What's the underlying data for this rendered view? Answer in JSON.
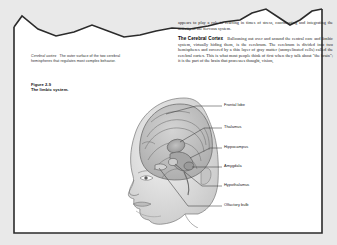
{
  "page": {
    "background_color": "#e9e9e9",
    "sheet_color": "#ffffff",
    "border_color": "#2b2b2b",
    "torn_edge": "jagged"
  },
  "left_column": {
    "glossary": {
      "term": "Cerebral cortex",
      "definition": "The outer surface of the two cerebral hemispheres that regulates most complex behavior."
    },
    "figure_caption": {
      "number": "Figure 2-9",
      "title": "The limbic system."
    }
  },
  "right_column": {
    "paragraph_top": "appears to play a role in reacting in times of stress, coordinating and integrating the activity of the nervous system.",
    "heading": "The Cerebral Cortex",
    "paragraph_body": "Ballooning out over and around the central core and limbic system, virtually hiding them, is the cerebrum. The cerebrum is divided into two hemispheres and covered by a thin layer of gray matter (unmyelinated cells) called the cerebral cortex. This is what most people think of first when they talk about \"the brain\"; it is the part of the brain that processes thought, vision,",
    "bold_phrase": "cerebral cortex"
  },
  "illustration": {
    "name": "limbic-system-diagram",
    "description": "Grayscale anatomical drawing of a human head in profile with the brain and limbic structures exposed",
    "labels": [
      {
        "id": "frontal-lobe",
        "text": "Frontal lobe"
      },
      {
        "id": "thalamus",
        "text": "Thalamus"
      },
      {
        "id": "hippocampus",
        "text": "Hippocampus"
      },
      {
        "id": "amygdala",
        "text": "Amygdala"
      },
      {
        "id": "hypothalamus",
        "text": "Hypothalamus"
      },
      {
        "id": "olfactory-bulb",
        "text": "Olfactory bulb"
      }
    ],
    "colors": {
      "skin": "#d8d8d8",
      "brain": "#bdbdbd",
      "outline": "#5a5a5a",
      "leader_line": "#3c3c3c"
    }
  }
}
